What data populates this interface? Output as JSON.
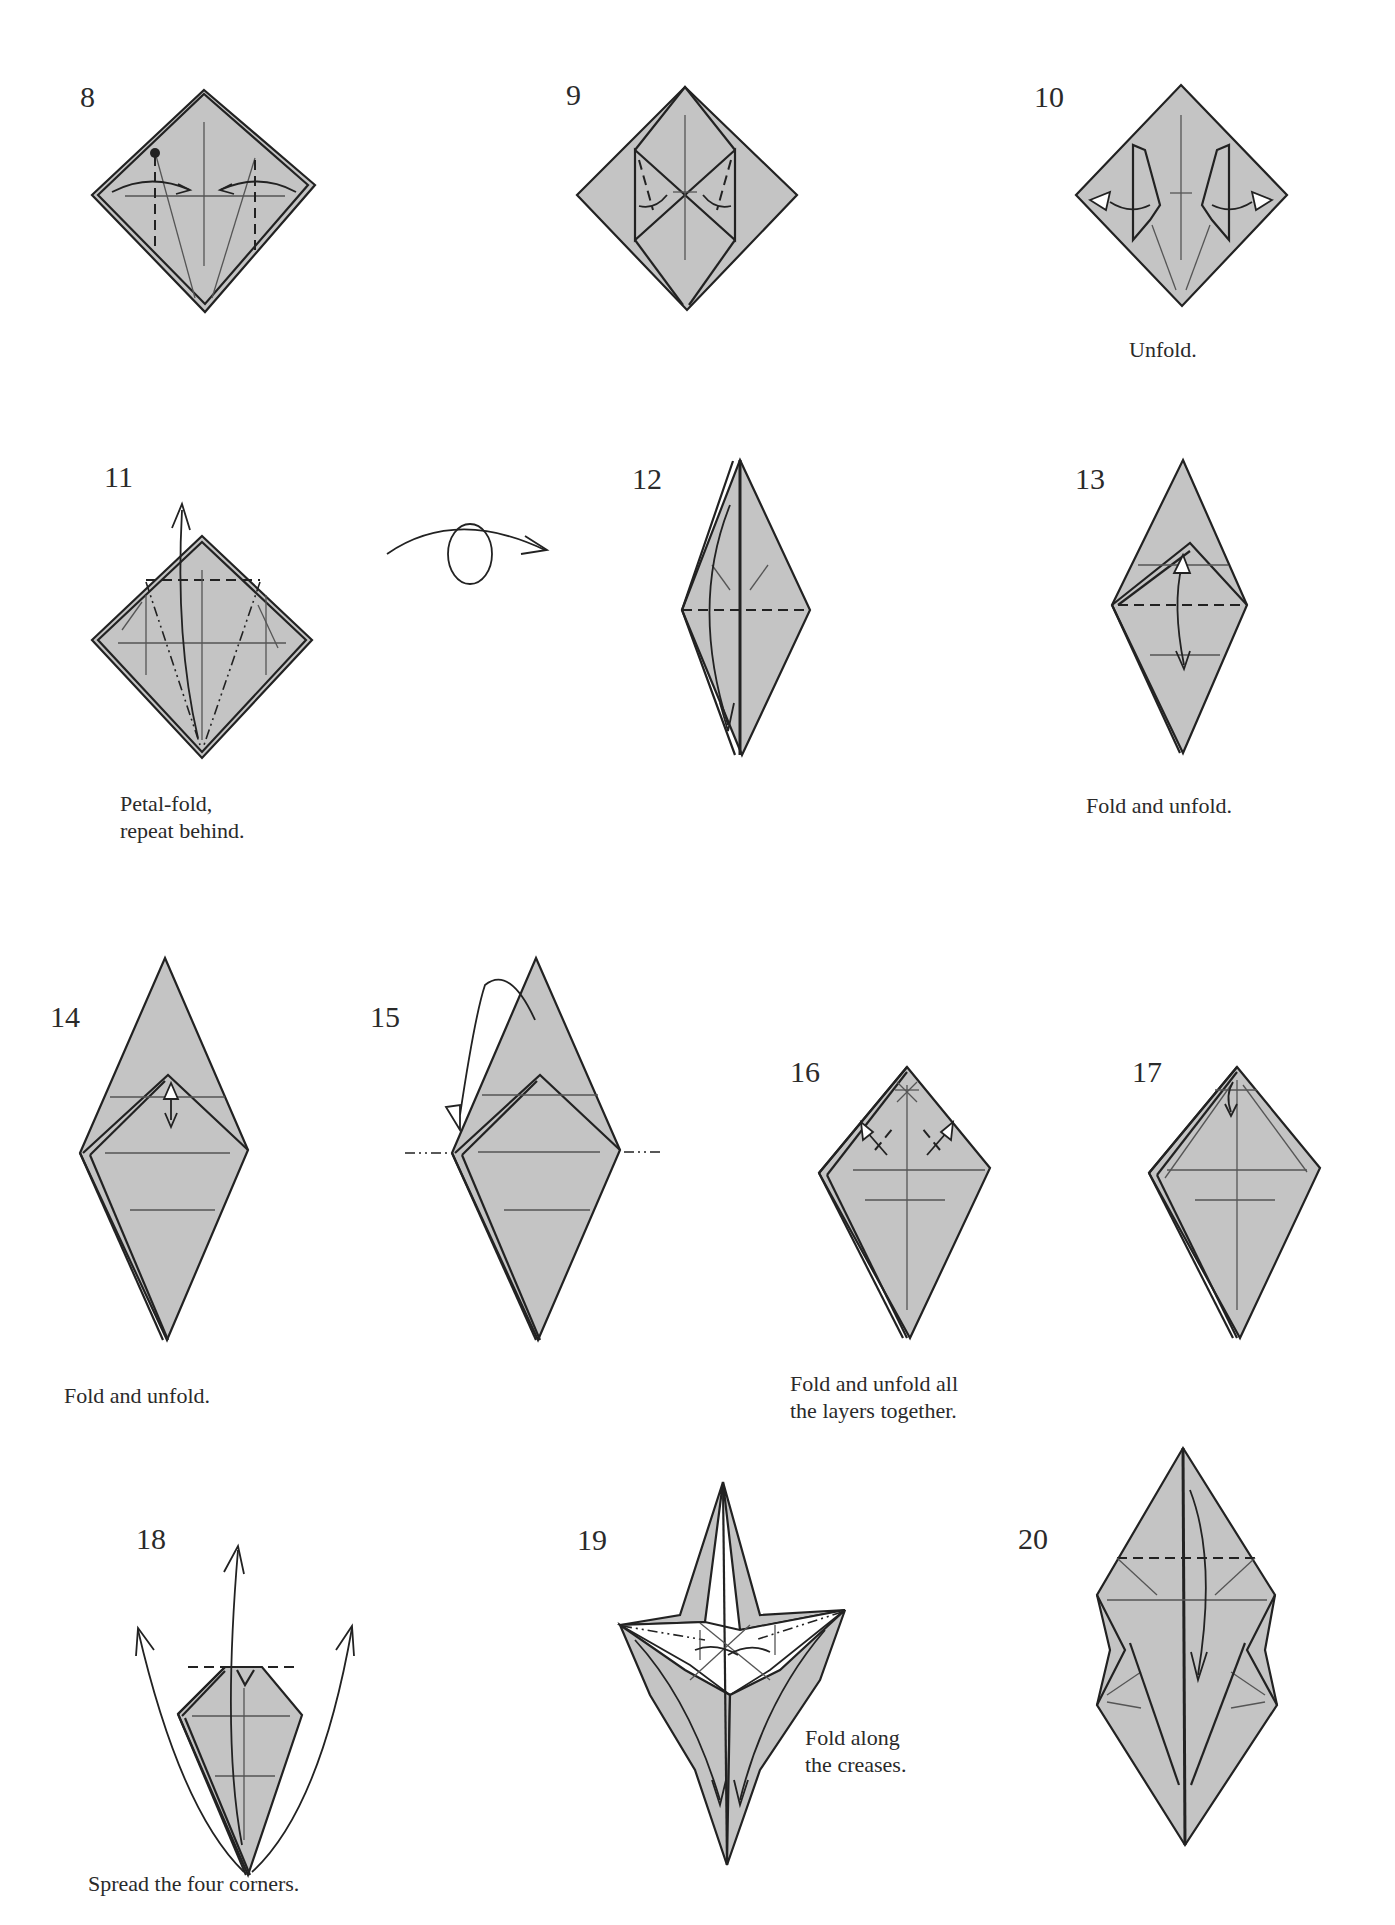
{
  "page": {
    "background": "#ffffff",
    "paper_color": "#c4c4c4",
    "line_color": "#222222"
  },
  "steps": [
    {
      "number": "8",
      "caption": ""
    },
    {
      "number": "9",
      "caption": ""
    },
    {
      "number": "10",
      "caption": "Unfold."
    },
    {
      "number": "11",
      "caption": "Petal-fold,\nrepeat behind."
    },
    {
      "number": "12",
      "caption": ""
    },
    {
      "number": "13",
      "caption": "Fold and unfold."
    },
    {
      "number": "14",
      "caption": "Fold and unfold."
    },
    {
      "number": "15",
      "caption": ""
    },
    {
      "number": "16",
      "caption": "Fold and unfold all\nthe layers together."
    },
    {
      "number": "17",
      "caption": ""
    },
    {
      "number": "18",
      "caption": "Spread the four corners."
    },
    {
      "number": "19",
      "caption": "Fold along\nthe creases."
    },
    {
      "number": "20",
      "caption": ""
    }
  ],
  "symbols": {
    "turn_over": "turn-over-symbol"
  }
}
